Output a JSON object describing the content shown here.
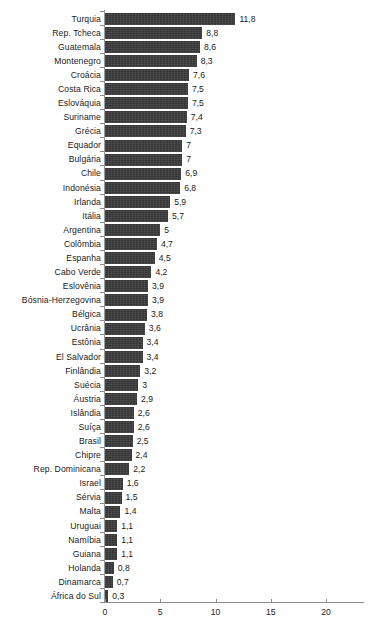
{
  "chart_data": {
    "type": "bar",
    "orientation": "horizontal",
    "title": "",
    "subtitle": "",
    "xlabel": "",
    "ylabel": "",
    "xlim": [
      0,
      22.5
    ],
    "xticks": [
      0,
      5,
      10,
      15,
      20
    ],
    "xtick_labels": [
      "0",
      "5",
      "10",
      "15",
      "20"
    ],
    "grid": false,
    "legend": null,
    "decimal_separator": ",",
    "bar_color": "#3b3b3b",
    "axis_color": "#8c8c8c",
    "background_color": "#ffffff",
    "categories": [
      "Turquia",
      "Rep. Tcheca",
      "Guatemala",
      "Montenegro",
      "Croácia",
      "Costa Rica",
      "Eslováquia",
      "Suriname",
      "Grécia",
      "Equador",
      "Bulgária",
      "Chile",
      "Indonésia",
      "Irlanda",
      "Itália",
      "Argentina",
      "Colômbia",
      "Espanha",
      "Cabo Verde",
      "Eslovênia",
      "Bósnia-Herzegovina",
      "Bélgica",
      "Ucrânia",
      "Estônia",
      "El Salvador",
      "Finlândia",
      "Suécia",
      "Áustria",
      "Islândia",
      "Suíça",
      "Brasil",
      "Chipre",
      "Rep. Dominicana",
      "Israel",
      "Sérvia",
      "Malta",
      "Uruguai",
      "Namíbia",
      "Guiana",
      "Holanda",
      "Dinamarca",
      "África do Sul"
    ],
    "values": [
      11.8,
      8.8,
      8.6,
      8.3,
      7.6,
      7.5,
      7.5,
      7.4,
      7.3,
      7,
      7,
      6.9,
      6.8,
      5.9,
      5.7,
      5,
      4.7,
      4.5,
      4.2,
      3.9,
      3.9,
      3.8,
      3.6,
      3.4,
      3.4,
      3.2,
      3,
      2.9,
      2.6,
      2.6,
      2.5,
      2.4,
      2.2,
      1.6,
      1.5,
      1.4,
      1.1,
      1.1,
      1.1,
      0.8,
      0.7,
      0.3
    ],
    "value_labels": [
      "11,8",
      "8,8",
      "8,6",
      "8,3",
      "7,6",
      "7,5",
      "7,5",
      "7,4",
      "7,3",
      "7",
      "7",
      "6,9",
      "6,8",
      "5,9",
      "5,7",
      "5",
      "4,7",
      "4,5",
      "4,2",
      "3,9",
      "3,9",
      "3,8",
      "3,6",
      "3,4",
      "3,4",
      "3,2",
      "3",
      "2,9",
      "2,6",
      "2,6",
      "2,5",
      "2,4",
      "2,2",
      "1,6",
      "1,5",
      "1,4",
      "1,1",
      "1,1",
      "1,1",
      "0,8",
      "0,7",
      "0,3"
    ]
  }
}
